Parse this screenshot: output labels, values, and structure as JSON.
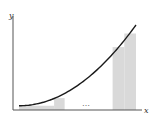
{
  "diagram": {
    "title": "",
    "x_label": "x",
    "y_label": "y",
    "ellipsis": "…",
    "curve": "increasing convex function (e.g. y = c + k·x²)",
    "colors": {
      "bar_fill": "#d9d9d9",
      "curve": "#1a1a1a",
      "axis": "#555555"
    },
    "domain": [
      0,
      1
    ],
    "function_min": 0.05,
    "function_max": 1.0,
    "rectangles": [
      {
        "group": "left",
        "x0": 0.0,
        "x1": 0.3,
        "height_fraction": 0.05
      },
      {
        "group": "left",
        "x0": 0.3,
        "x1": 0.39,
        "height_fraction": 0.14
      },
      {
        "group": "right",
        "x0": 0.8,
        "x1": 0.9,
        "height_fraction": 0.74
      },
      {
        "group": "right",
        "x0": 0.9,
        "x1": 1.0,
        "height_fraction": 0.9
      }
    ]
  }
}
